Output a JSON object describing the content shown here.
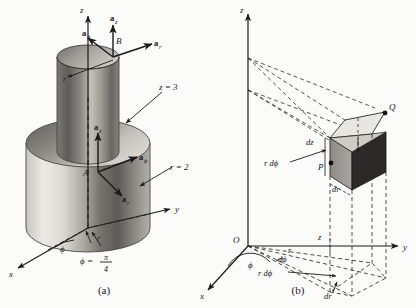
{
  "figure": {
    "background_color": "#fbfbfa",
    "ink_color": "#1a1a1a",
    "panels": [
      {
        "id": "panel-a",
        "caption": "(a)",
        "description": "Point P in cylindrical coordinates on a cylinder r = 2, z = 3, phi = pi/4 with unit vectors at A and B",
        "axes": {
          "z": "z",
          "y": "y",
          "x": "x"
        },
        "surface_labels": [
          {
            "name": "z-equals-3",
            "text": "z = 3"
          },
          {
            "name": "r-equals-2",
            "text": "r = 2"
          }
        ],
        "angle_labels": [
          {
            "name": "phi-angle",
            "text": "ϕ"
          },
          {
            "name": "phi-value",
            "text": "ϕ =",
            "fraction_numerator": "π",
            "fraction_denominator": "4"
          },
          {
            "name": "r-segment",
            "text": "r"
          }
        ],
        "points": [
          {
            "name": "point-B",
            "label": "B"
          },
          {
            "name": "point-A",
            "label": "A"
          }
        ],
        "unit_vectors_B": [
          {
            "name": "a-phi-at-B",
            "base": "a",
            "sub": "ϕ"
          },
          {
            "name": "a-z-at-B",
            "base": "a",
            "sub": "z"
          },
          {
            "name": "a-r-at-B",
            "base": "a",
            "sub": "r"
          }
        ],
        "unit_vectors_A": [
          {
            "name": "a-z-at-A",
            "base": "a",
            "sub": "z"
          },
          {
            "name": "a-phi-at-A",
            "base": "a",
            "sub": "ϕ"
          },
          {
            "name": "a-r-at-A",
            "base": "a",
            "sub": "r"
          }
        ],
        "inner_label": {
          "name": "inner-r-label",
          "text": "r"
        },
        "colors": {
          "cylinder_light": "#e9e7e2",
          "cylinder_mid": "#b9b6b0",
          "cylinder_dark": "#6e6c68",
          "top_face": "#cfccc6"
        }
      },
      {
        "id": "panel-b",
        "caption": "(b)",
        "description": "Differential volume element in cylindrical coordinates with corners P and Q",
        "axes": {
          "z": "z",
          "y": "y",
          "x": "x"
        },
        "origin_label": "O",
        "points": [
          {
            "name": "point-Q",
            "label": "Q"
          },
          {
            "name": "point-P",
            "label": "P"
          }
        ],
        "differential_labels": [
          {
            "name": "dz-label",
            "text": "dz"
          },
          {
            "name": "r-dphi-label-upper",
            "text": "r dϕ"
          },
          {
            "name": "dr-label-upper",
            "text": "dr"
          },
          {
            "name": "z-height-label",
            "text": "z"
          },
          {
            "name": "phi-angle-label",
            "text": "ϕ"
          },
          {
            "name": "dphi-angle-label",
            "text": "dϕ"
          },
          {
            "name": "r-radius-label",
            "text": "r"
          },
          {
            "name": "r-dphi-label-lower",
            "text": "r dϕ"
          },
          {
            "name": "dr-label-lower",
            "text": "dr"
          }
        ],
        "colors": {
          "volume_light": "#e8e6e1",
          "volume_mid": "#9a9792",
          "volume_dark": "#2b2a28"
        }
      }
    ]
  }
}
